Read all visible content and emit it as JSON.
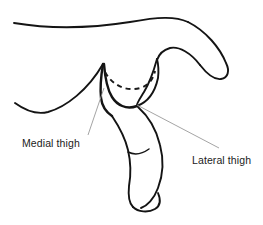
{
  "figure": {
    "type": "anatomical-line-drawing",
    "background_color": "#ffffff",
    "line_color": "#141414",
    "leader_line_color": "#9a9a9a",
    "labels": [
      {
        "id": "medial-thigh",
        "text": "Medial thigh",
        "text_x": 22,
        "text_y": 147,
        "leader": {
          "x1": 88,
          "y1": 135,
          "x2": 104,
          "y2": 88
        }
      },
      {
        "id": "lateral-thigh",
        "text": "Lateral thigh",
        "text_x": 192,
        "text_y": 164,
        "leader": {
          "x1": 219,
          "y1": 148,
          "x2": 137,
          "y2": 105
        }
      }
    ],
    "strokes": {
      "top_back_contour": "M14,23 C50,29 92,28 130,22 C158,17 175,16 188,22",
      "upper_arm_outer": "M188,22 C206,31 220,48 226,63 C230,71 228,78 221,79 C214,80 207,74 200,65",
      "upper_arm_inner": "M200,65 C191,53 179,46 170,48 C163,50 159,54 157,60",
      "left_flank": "M15,103 C26,111 36,115 48,112 C66,107 88,90 103,64",
      "peak_inner_left": "M103,64 C101,76 100,88 101,98 C102,106 106,112 112,116",
      "peak_inner_left2": "M104,64 C105,77 107,89 112,97 C117,105 126,110 137,106",
      "groin_curve": "M137,106 C148,102 155,92 158,78 C159,70 158,63 157,59",
      "hip_right_outline": "M157,59 C154,70 150,82 144,92 C139,100 136,104 137,106",
      "thigh_outer": "M138,107 C147,115 156,128 160,145 C164,160 163,175 158,188 C154,199 147,206 141,208",
      "thigh_inner": "M112,116 C118,125 125,137 128,150 C131,163 131,175 129,186 C128,196 129,203 133,207",
      "foot_outline": "M133,207 C138,212 148,213 155,209 C160,206 161,200 158,193",
      "calf_crease": "M128,152 C134,155 142,154 149,149"
    },
    "dashed_arc": "M105,72 C112,85 126,92 140,88 C148,86 153,80 155,71"
  }
}
